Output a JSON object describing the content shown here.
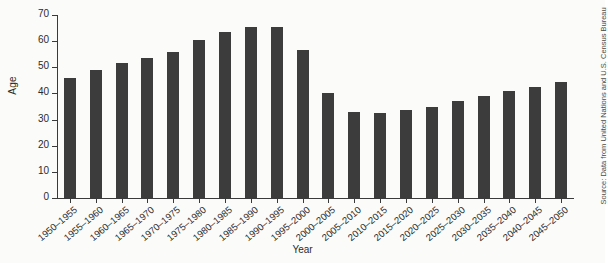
{
  "chart_data": {
    "type": "bar",
    "title": "",
    "subtitle": "",
    "xlabel": "Year",
    "ylabel": "Age",
    "ylim": [
      0,
      70
    ],
    "yticks": [
      0,
      10,
      20,
      30,
      40,
      50,
      60,
      70
    ],
    "grid": false,
    "legend": "none",
    "bar_color": "#3c3c3c",
    "categories": [
      "1950–1955",
      "1955–1960",
      "1960–1965",
      "1965–1970",
      "1970–1975",
      "1975–1980",
      "1980–1985",
      "1985–1990",
      "1990–1995",
      "1995–2000",
      "2000–2005",
      "2005–2010",
      "2010–2015",
      "2015–2020",
      "2020–2025",
      "2025–2030",
      "2030–2035",
      "2035–2040",
      "2040–2045",
      "2045–2050"
    ],
    "values": [
      46,
      49,
      51.5,
      53.5,
      56,
      60.5,
      63.5,
      65.5,
      65.5,
      56.5,
      40,
      33,
      32.5,
      33.5,
      35,
      37,
      39,
      41,
      42.5,
      44.5
    ],
    "annotations": [
      "Source: Data from United Nations and U.S. Census Bureau"
    ]
  },
  "source": {
    "text": "Source: Data from United Nations and U.S. Census Bureau"
  }
}
